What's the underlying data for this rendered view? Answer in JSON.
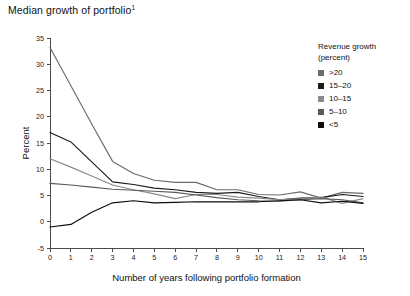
{
  "title": {
    "text": "Median growth of portfolio",
    "superscript": "1"
  },
  "legend": {
    "title_line1": "Revenue growth",
    "title_line2": "(percent)",
    "entries": [
      {
        "label": ">20",
        "color": "#6b6b6b"
      },
      {
        "label": "15–20",
        "color": "#1a1a1a"
      },
      {
        "label": "10–15",
        "color": "#8a8a8a"
      },
      {
        "label": "5–10",
        "color": "#5a5a5a"
      },
      {
        "label": "<5",
        "color": "#0d0d0d"
      }
    ]
  },
  "axes": {
    "y_title": "Percent",
    "x_title": "Number of years following portfolio formation",
    "y_ticks": [
      "35",
      "30",
      "25",
      "20",
      "15",
      "10",
      "5",
      "0",
      "-5"
    ],
    "x_ticks": [
      "0",
      "1",
      "2",
      "3",
      "4",
      "5",
      "6",
      "7",
      "8",
      "9",
      "10",
      "11",
      "12",
      "13",
      "14",
      "15"
    ]
  },
  "chart_data": {
    "type": "line",
    "title": "Median growth of portfolio",
    "xlabel": "Number of years following portfolio formation",
    "ylabel": "Percent",
    "xlim": [
      0,
      15
    ],
    "ylim": [
      -5,
      35
    ],
    "grid": false,
    "legend_position": "right",
    "legend_title": "Revenue growth (percent)",
    "x": [
      0,
      1,
      2,
      3,
      4,
      5,
      6,
      7,
      8,
      9,
      10,
      11,
      12,
      13,
      14,
      15
    ],
    "series": [
      {
        "name": ">20",
        "color": "#6b6b6b",
        "values": [
          33.2,
          25.9,
          18.6,
          11.5,
          9.2,
          7.9,
          7.5,
          7.5,
          6.1,
          6.1,
          5.2,
          5.1,
          5.7,
          4.5,
          5.6,
          5.4
        ]
      },
      {
        "name": "15–20",
        "color": "#1a1a1a",
        "values": [
          17.0,
          15.2,
          11.4,
          7.6,
          7.1,
          6.4,
          6.1,
          5.6,
          5.4,
          5.6,
          4.8,
          4.2,
          4.5,
          4.6,
          5.2,
          4.8
        ]
      },
      {
        "name": "10–15",
        "color": "#8a8a8a",
        "values": [
          12.0,
          10.4,
          8.7,
          7.0,
          6.1,
          5.3,
          4.4,
          5.2,
          5.2,
          4.7,
          4.5,
          4.2,
          4.4,
          4.7,
          3.5,
          4.4
        ]
      },
      {
        "name": "5–10",
        "color": "#5a5a5a",
        "values": [
          7.3,
          7.0,
          6.6,
          6.2,
          6.0,
          5.8,
          5.6,
          5.1,
          4.6,
          4.2,
          4.0,
          3.9,
          4.2,
          4.4,
          4.2,
          3.6
        ]
      },
      {
        "name": "<5",
        "color": "#0d0d0d",
        "values": [
          -1.0,
          -0.5,
          1.8,
          3.6,
          4.0,
          3.6,
          3.7,
          3.8,
          3.8,
          3.8,
          3.8,
          4.0,
          4.2,
          3.6,
          3.9,
          3.5
        ]
      }
    ]
  }
}
